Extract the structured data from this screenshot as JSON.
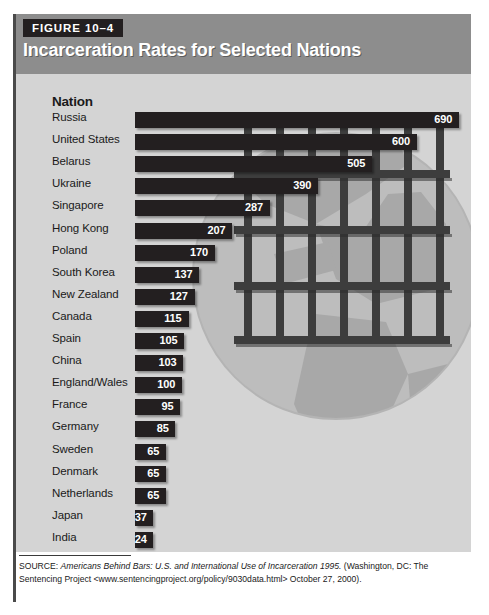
{
  "figure": {
    "tag": "FIGURE 10–4",
    "title": "Incarceration Rates for Selected Nations",
    "column_header": "Nation",
    "colors": {
      "header_band": "#8d8d8d",
      "panel_background": "#d4d4d4",
      "bar": "#231f20",
      "tag_background": "#231f20",
      "title_text": "#ffffff",
      "footer_background": "#ffffff"
    }
  },
  "chart_data": {
    "type": "bar",
    "orientation": "horizontal",
    "title": "Incarceration Rates for Selected Nations",
    "xlabel": "",
    "ylabel": "Nation",
    "xlim": [
      0,
      690
    ],
    "grid": false,
    "legend": null,
    "categories": [
      "Russia",
      "United States",
      "Belarus",
      "Ukraine",
      "Singapore",
      "Hong Kong",
      "Poland",
      "South Korea",
      "New Zealand",
      "Canada",
      "Spain",
      "China",
      "England/Wales",
      "France",
      "Germany",
      "Sweden",
      "Denmark",
      "Netherlands",
      "Japan",
      "India"
    ],
    "values": [
      690,
      600,
      505,
      390,
      287,
      207,
      170,
      137,
      127,
      115,
      105,
      103,
      100,
      95,
      85,
      65,
      65,
      65,
      37,
      24
    ],
    "rows": [
      {
        "label": "Russia",
        "value": 690
      },
      {
        "label": "United States",
        "value": 600
      },
      {
        "label": "Belarus",
        "value": 505
      },
      {
        "label": "Ukraine",
        "value": 390
      },
      {
        "label": "Singapore",
        "value": 287
      },
      {
        "label": "Hong Kong",
        "value": 207
      },
      {
        "label": "Poland",
        "value": 170
      },
      {
        "label": "South Korea",
        "value": 137
      },
      {
        "label": "New Zealand",
        "value": 127
      },
      {
        "label": "Canada",
        "value": 115
      },
      {
        "label": "Spain",
        "value": 105
      },
      {
        "label": "China",
        "value": 103
      },
      {
        "label": "England/Wales",
        "value": 100
      },
      {
        "label": "France",
        "value": 95
      },
      {
        "label": "Germany",
        "value": 85
      },
      {
        "label": "Sweden",
        "value": 65
      },
      {
        "label": "Denmark",
        "value": 65
      },
      {
        "label": "Netherlands",
        "value": 65
      },
      {
        "label": "Japan",
        "value": 37
      },
      {
        "label": "India",
        "value": 24
      }
    ]
  },
  "artwork": {
    "name": "globe-behind-prison-bars",
    "vertical_bars": 7,
    "horizontal_bars": 5
  },
  "source": {
    "prefix": "SOURCE: ",
    "italic_title": "Americans Behind Bars: U.S. and International Use of Incarceration 1995.",
    "rest": " (Washington, DC: The Sentencing Project <www.sentencingproject.org/policy/9030data.html> October 27, 2000)."
  }
}
